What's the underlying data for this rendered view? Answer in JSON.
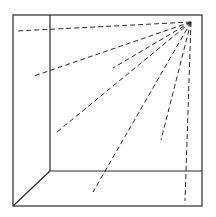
{
  "diagram": {
    "colors": {
      "background": "#ffffff",
      "line": "#2a2a2a"
    },
    "outer_square": {
      "x1": 13,
      "y1": 15,
      "x2": 202,
      "y2": 206
    },
    "inner_vertical": {
      "x1": 50,
      "y1": 15,
      "x2": 50,
      "y2": 171
    },
    "inner_horizontal": {
      "x1": 50,
      "y1": 171,
      "x2": 202,
      "y2": 171
    },
    "diagonal": {
      "x1": 13,
      "y1": 206,
      "x2": 50,
      "y2": 171
    },
    "origin": {
      "x": 191,
      "y": 22
    },
    "rays": [
      {
        "x": 17,
        "y": 31
      },
      {
        "x": 34,
        "y": 76
      },
      {
        "x": 113,
        "y": 68
      },
      {
        "x": 57,
        "y": 132
      },
      {
        "x": 93,
        "y": 192
      },
      {
        "x": 161,
        "y": 140
      },
      {
        "x": 185,
        "y": 201
      }
    ]
  }
}
